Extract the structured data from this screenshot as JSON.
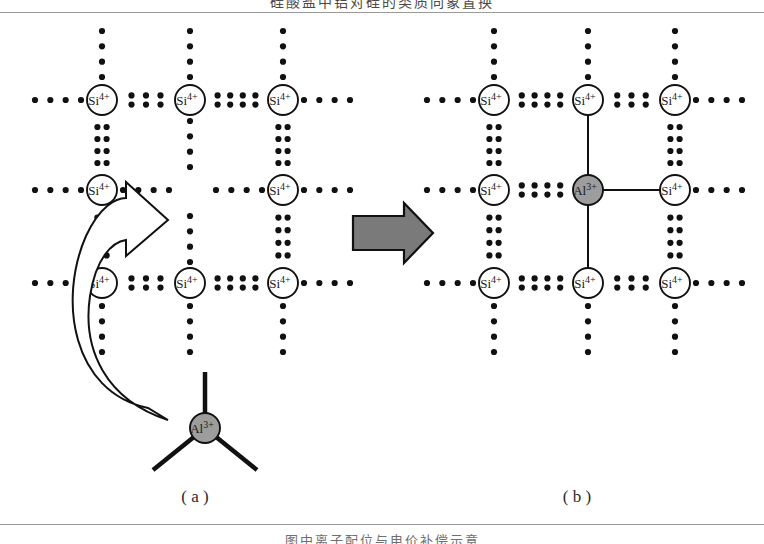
{
  "page": {
    "clipped_header_text": "硅酸盐中铝对硅的类质同象置换",
    "clipped_footer_text": "图中离子配位与电价补偿示意"
  },
  "figure": {
    "panels": [
      {
        "id": "a",
        "caption": "( a )",
        "description": "Original silicate lattice with a vacant central site and an incoming Al3+ unit",
        "lattice": {
          "columns_x": [
            102,
            190,
            283
          ],
          "rows_y": [
            100,
            190,
            283
          ],
          "sites": [
            {
              "row": 0,
              "col": 0,
              "label": "Si",
              "charge": "4+",
              "kind": "si"
            },
            {
              "row": 0,
              "col": 1,
              "label": "Si",
              "charge": "4+",
              "kind": "si"
            },
            {
              "row": 0,
              "col": 2,
              "label": "Si",
              "charge": "4+",
              "kind": "si"
            },
            {
              "row": 1,
              "col": 0,
              "label": "Si",
              "charge": "4+",
              "kind": "si"
            },
            {
              "row": 1,
              "col": 2,
              "label": "Si",
              "charge": "4+",
              "kind": "si"
            },
            {
              "row": 2,
              "col": 0,
              "label": "Si",
              "charge": "4+",
              "kind": "si"
            },
            {
              "row": 2,
              "col": 1,
              "label": "Si",
              "charge": "4+",
              "kind": "si"
            },
            {
              "row": 2,
              "col": 2,
              "label": "Si",
              "charge": "4+",
              "kind": "si"
            }
          ],
          "vacant_site": {
            "row": 1,
            "col": 1
          }
        },
        "inset": {
          "label": "Al",
          "charge": "3+",
          "kind": "al",
          "bond_count": 3,
          "bond_style": "solid",
          "center": {
            "x": 205,
            "y": 428
          }
        },
        "curved_arrow": {
          "name": "substitution-arrow",
          "from": "Al3+ inset",
          "to": "vacant lattice site",
          "style": "hollow-outline"
        }
      },
      {
        "id": "b",
        "caption": "( b )",
        "description": "Lattice after Al3+ occupies the central site, forming solid bonds",
        "lattice": {
          "columns_x": [
            494,
            588,
            675
          ],
          "rows_y": [
            100,
            190,
            283
          ],
          "sites": [
            {
              "row": 0,
              "col": 0,
              "label": "Si",
              "charge": "4+",
              "kind": "si"
            },
            {
              "row": 0,
              "col": 1,
              "label": "Si",
              "charge": "4+",
              "kind": "si"
            },
            {
              "row": 0,
              "col": 2,
              "label": "Si",
              "charge": "4+",
              "kind": "si"
            },
            {
              "row": 1,
              "col": 0,
              "label": "Si",
              "charge": "4+",
              "kind": "si"
            },
            {
              "row": 1,
              "col": 1,
              "label": "Al",
              "charge": "3+",
              "kind": "al"
            },
            {
              "row": 1,
              "col": 2,
              "label": "Si",
              "charge": "4+",
              "kind": "si"
            },
            {
              "row": 2,
              "col": 0,
              "label": "Si",
              "charge": "4+",
              "kind": "si"
            },
            {
              "row": 2,
              "col": 1,
              "label": "Si",
              "charge": "4+",
              "kind": "si"
            },
            {
              "row": 2,
              "col": 2,
              "label": "Si",
              "charge": "4+",
              "kind": "si"
            }
          ],
          "solid_bonds": [
            {
              "from": {
                "row": 0,
                "col": 1
              },
              "to": {
                "row": 1,
                "col": 1
              }
            },
            {
              "from": {
                "row": 1,
                "col": 1
              },
              "to": {
                "row": 2,
                "col": 1
              }
            },
            {
              "from": {
                "row": 1,
                "col": 1
              },
              "to": {
                "row": 1,
                "col": 2
              }
            }
          ]
        }
      }
    ],
    "transition_arrow": {
      "name": "transition-arrow",
      "direction": "right",
      "fill": "#7a7a7a",
      "stroke": "#111111"
    },
    "legend_semantics": {
      "dotted_bond": "ionic / electrostatic interaction shown as paired dots",
      "solid_bond": "covalent bond line"
    }
  },
  "colors": {
    "si_fill": "#ffffff",
    "al_fill": "#9d9d9d",
    "atom_stroke": "#111111",
    "dot": "#111111",
    "arrow_fill": "#7a7a7a",
    "rule": "#9a9a9a",
    "text": "#1a1a1a"
  }
}
